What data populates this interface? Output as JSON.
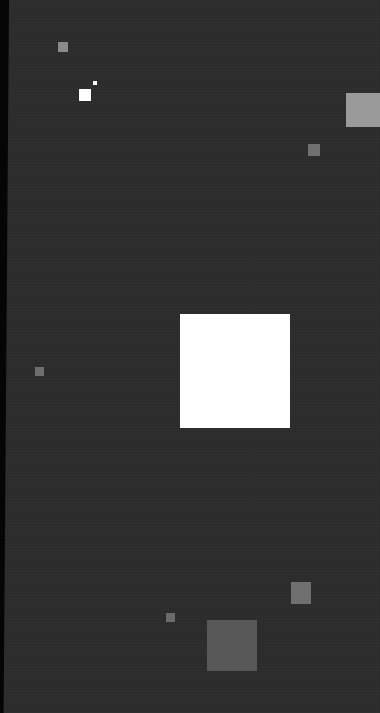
{
  "canvas": {
    "width": 380,
    "height": 713,
    "background_color": "#2c2c2c",
    "edge_strip_color": "#050505"
  },
  "shapes": [
    {
      "id": "gray-square-top-left",
      "x": 58,
      "y": 42,
      "w": 10,
      "h": 10,
      "color": "#8a8a8a"
    },
    {
      "id": "white-dot-top-left",
      "x": 93,
      "y": 81,
      "w": 4,
      "h": 4,
      "color": "#ffffff"
    },
    {
      "id": "white-square-top-left",
      "x": 79,
      "y": 89,
      "w": 12,
      "h": 12,
      "color": "#ffffff"
    },
    {
      "id": "light-gray-square-top-right",
      "x": 346,
      "y": 93,
      "w": 34,
      "h": 34,
      "color": "#9a9a9a"
    },
    {
      "id": "gray-square-right",
      "x": 308,
      "y": 144,
      "w": 12,
      "h": 12,
      "color": "#707070"
    },
    {
      "id": "white-square-center",
      "x": 180,
      "y": 314,
      "w": 110,
      "h": 114,
      "color": "#ffffff"
    },
    {
      "id": "gray-square-left",
      "x": 35,
      "y": 367,
      "w": 9,
      "h": 9,
      "color": "#6e6e6e"
    },
    {
      "id": "gray-square-bottom-right",
      "x": 291,
      "y": 582,
      "w": 20,
      "h": 22,
      "color": "#707070"
    },
    {
      "id": "gray-square-bottom-small",
      "x": 166,
      "y": 613,
      "w": 9,
      "h": 9,
      "color": "#6a6a6a"
    },
    {
      "id": "gray-square-bottom-large",
      "x": 207,
      "y": 620,
      "w": 50,
      "h": 51,
      "color": "#585858"
    }
  ]
}
